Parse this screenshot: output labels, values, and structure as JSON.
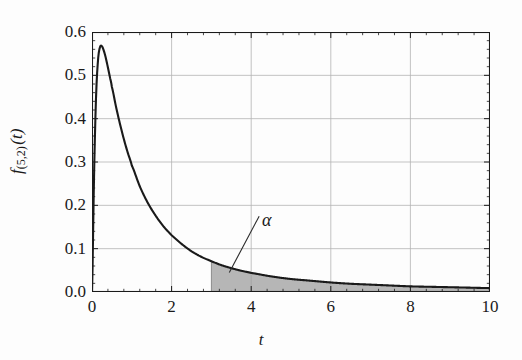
{
  "chart_data": {
    "type": "line",
    "title": "",
    "xlabel": "t",
    "ylabel": "f(5,2) (t)",
    "ylabel_base": "f",
    "ylabel_subscript": "(5,2)",
    "ylabel_arg": "(t)",
    "xlim": [
      0,
      10
    ],
    "ylim": [
      0,
      0.6
    ],
    "xticks": [
      0,
      2,
      4,
      6,
      8,
      10
    ],
    "xtick_labels": [
      "0",
      "2",
      "4",
      "6",
      "8",
      "10"
    ],
    "yticks": [
      0.0,
      0.1,
      0.2,
      0.3,
      0.4,
      0.5,
      0.6
    ],
    "ytick_labels": [
      "0.0",
      "0.1",
      "0.2",
      "0.3",
      "0.4",
      "0.5",
      "0.6"
    ],
    "minor_ticks_per_interval": 4,
    "grid": true,
    "grid_color": "#b4b4b4",
    "legend": "none",
    "curve_color": "#1a1a1a",
    "curve_width": 2.1,
    "fill_color": "#9a9a9a",
    "fill_opacity": 0.72,
    "fill_edge_color": "#6e6e6e",
    "distribution": "F-distribution density with d1 = 5, d2 = 2",
    "peak": {
      "x": 0.3,
      "y": 0.57
    },
    "shaded_region": {
      "label": "alpha",
      "label_text": "α",
      "from_x": 3,
      "to_x": 10,
      "description": "right tail area from t = 3 to t = 10"
    },
    "annotations": [
      {
        "text": "α",
        "x": 4.3,
        "y": 0.195,
        "leader_line_from": [
          4.2,
          0.175
        ],
        "leader_line_to": [
          3.45,
          0.045
        ]
      }
    ],
    "x": [
      0.0,
      0.05,
      0.1,
      0.15,
      0.2,
      0.25,
      0.3,
      0.35,
      0.4,
      0.45,
      0.5,
      0.6,
      0.7,
      0.8,
      0.9,
      1.0,
      1.2,
      1.4,
      1.6,
      1.8,
      2.0,
      2.25,
      2.5,
      2.75,
      3.0,
      3.25,
      3.5,
      3.75,
      4.0,
      4.5,
      5.0,
      5.5,
      6.0,
      6.5,
      7.0,
      7.5,
      8.0,
      8.5,
      9.0,
      9.5,
      10.0
    ],
    "y": [
      0.0,
      0.262,
      0.446,
      0.534,
      0.565,
      0.567,
      0.556,
      0.539,
      0.518,
      0.496,
      0.473,
      0.429,
      0.389,
      0.353,
      0.321,
      0.292,
      0.244,
      0.206,
      0.176,
      0.151,
      0.131,
      0.111,
      0.094,
      0.081,
      0.071,
      0.062,
      0.055,
      0.049,
      0.044,
      0.036,
      0.03,
      0.026,
      0.022,
      0.019,
      0.017,
      0.015,
      0.013,
      0.012,
      0.011,
      0.01,
      0.009
    ]
  },
  "axis": {
    "frame_color": "#1a1a1a",
    "tick_color": "#1a1a1a"
  }
}
